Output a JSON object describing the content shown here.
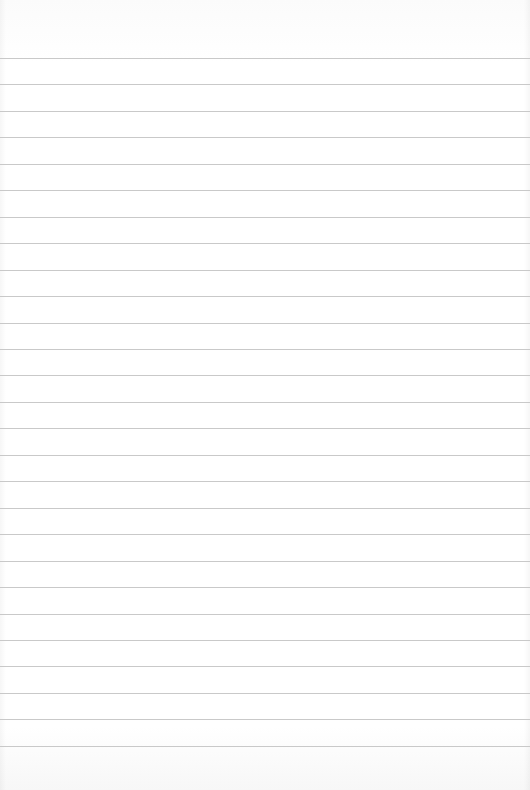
{
  "paper": {
    "type": "lined-paper",
    "background_color": "#ffffff",
    "rule_color": "#c9c9c9",
    "rule_count": 27,
    "first_rule_y": 58,
    "rule_spacing": 26.46,
    "rule_positions": [
      58,
      84,
      111,
      137,
      164,
      190,
      217,
      243,
      270,
      296,
      323,
      349,
      375,
      402,
      428,
      455,
      481,
      508,
      534,
      561,
      587,
      614,
      640,
      666,
      693,
      719,
      746
    ],
    "text": ""
  }
}
